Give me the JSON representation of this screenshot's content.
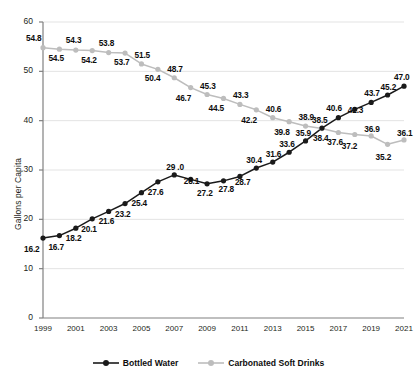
{
  "chart_data": {
    "type": "line",
    "title": "",
    "xlabel": "",
    "ylabel": "Gallons per Capita",
    "ylim": [
      0,
      60
    ],
    "yticks": [
      0,
      10,
      20,
      30,
      40,
      50,
      60
    ],
    "grid": true,
    "grid_axis": "y",
    "legend_position": "bottom",
    "x": [
      1999,
      2000,
      2001,
      2002,
      2003,
      2004,
      2005,
      2006,
      2007,
      2008,
      2009,
      2010,
      2011,
      2012,
      2013,
      2014,
      2015,
      2016,
      2017,
      2018,
      2019,
      2020,
      2021
    ],
    "xtick_labels": [
      "1999",
      "2001",
      "2003",
      "2005",
      "2007",
      "2009",
      "2011",
      "2013",
      "2015",
      "2017",
      "2019",
      "2021"
    ],
    "xticks": [
      1999,
      2001,
      2003,
      2005,
      2007,
      2009,
      2011,
      2013,
      2015,
      2017,
      2019,
      2021
    ],
    "series": [
      {
        "name": "Bottled Water",
        "color": "#1a1a1a",
        "marker": "circle-filled",
        "values": [
          16.2,
          16.7,
          18.2,
          20.1,
          21.6,
          23.2,
          25.4,
          27.6,
          29.0,
          28.1,
          27.2,
          27.8,
          28.7,
          30.4,
          31.6,
          33.6,
          35.9,
          38.5,
          40.6,
          42.3,
          43.7,
          45.2,
          47.0
        ],
        "labels": [
          "16.2",
          "16.7",
          "18.2",
          "20.1",
          "21.6",
          "23.2",
          "25.4",
          "27.6",
          "29 .0",
          "28.1",
          "27.2",
          "27.8",
          "28.7",
          "30.4",
          "31.6",
          "33.6",
          "35.9",
          "38.5",
          "40.6",
          "42.3",
          "43.7",
          "45.2",
          "47.0"
        ]
      },
      {
        "name": "Carbonated Soft Drinks",
        "color": "#bdbdbd",
        "marker": "circle-filled",
        "values": [
          54.8,
          54.5,
          54.3,
          54.2,
          53.8,
          53.7,
          51.5,
          50.4,
          48.7,
          46.7,
          45.3,
          44.5,
          43.3,
          42.2,
          40.6,
          39.8,
          38.9,
          38.4,
          37.6,
          37.2,
          36.9,
          35.2,
          36.1
        ],
        "labels": [
          "54.8",
          "54.5",
          "54.3",
          "54.2",
          "53.8",
          "53.7",
          "51.5",
          "50.4",
          "48.7",
          "46.7",
          "45.3",
          "44.5",
          "43.3",
          "42.2",
          "40.6",
          "39.8",
          "38.9",
          "38.4",
          "37.6",
          "37.2",
          "36.9",
          "35.2",
          "36.1"
        ]
      }
    ]
  },
  "legend": {
    "items": [
      {
        "label": "Bottled Water",
        "color": "#1a1a1a"
      },
      {
        "label": "Carbonated Soft Drinks",
        "color": "#bdbdbd"
      }
    ]
  },
  "colors": {
    "bottled_water": "#1a1a1a",
    "carbonated_soft_drinks": "#bdbdbd",
    "axis": "#808080",
    "grid": "#e3e3e3",
    "text": "#231f20"
  }
}
